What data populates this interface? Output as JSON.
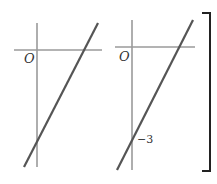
{
  "graphs": [
    {
      "id": "left",
      "origin_label": "O",
      "y_intercept_label": ""
    },
    {
      "id": "right",
      "origin_label": "O",
      "y_intercept_label": "−3"
    }
  ],
  "colors": {
    "axis": "#9a9a9a",
    "line": "#555555",
    "bracket": "#222222"
  }
}
